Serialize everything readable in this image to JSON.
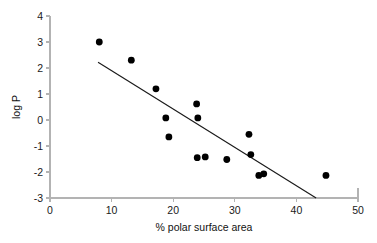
{
  "chart_data": {
    "type": "scatter",
    "title": "",
    "xlabel": "% polar surface area",
    "ylabel": "log P",
    "xlim": [
      0,
      50
    ],
    "ylim": [
      -3,
      4
    ],
    "xticks": [
      "0",
      "10",
      "20",
      "30",
      "40",
      "50"
    ],
    "xtick_values": [
      0,
      10,
      20,
      30,
      40,
      50
    ],
    "yticks": [
      "4",
      "3",
      "2",
      "1",
      "0",
      "-1",
      "-2",
      "-3"
    ],
    "ytick_values": [
      4,
      3,
      2,
      1,
      0,
      -1,
      -2,
      -3
    ],
    "grid": false,
    "legend": null,
    "marker": "filled-circle",
    "marker_color": "#000000",
    "points": [
      {
        "x": 8.0,
        "y": 3.0
      },
      {
        "x": 13.2,
        "y": 2.3
      },
      {
        "x": 17.2,
        "y": 1.2
      },
      {
        "x": 18.8,
        "y": 0.08
      },
      {
        "x": 19.3,
        "y": -0.65
      },
      {
        "x": 23.8,
        "y": 0.62
      },
      {
        "x": 24.0,
        "y": 0.08
      },
      {
        "x": 23.9,
        "y": -1.45
      },
      {
        "x": 25.2,
        "y": -1.42
      },
      {
        "x": 28.7,
        "y": -1.52
      },
      {
        "x": 32.3,
        "y": -0.55
      },
      {
        "x": 32.6,
        "y": -1.33
      },
      {
        "x": 33.9,
        "y": -2.13
      },
      {
        "x": 34.7,
        "y": -2.07
      },
      {
        "x": 44.8,
        "y": -2.13
      }
    ],
    "trendline": {
      "type": "line",
      "color": "#1a1a1a",
      "x_start": 7.8,
      "y_start": 2.22,
      "x_end": 43.2,
      "y_end": -3.0
    }
  }
}
